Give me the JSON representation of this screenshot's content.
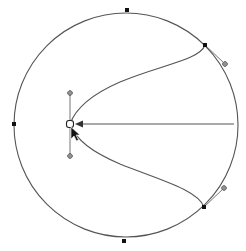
{
  "canvas": {
    "width": 246,
    "height": 251,
    "background": "#ffffff",
    "stroke_color": "#555555"
  },
  "circle": {
    "cx": 126,
    "cy": 125,
    "r": 112
  },
  "anchors": [
    {
      "id": "top",
      "x": 127,
      "y": 10
    },
    {
      "id": "left",
      "x": 14,
      "y": 124
    },
    {
      "id": "bottom",
      "x": 124,
      "y": 241
    },
    {
      "id": "upper-right",
      "x": 205,
      "y": 45
    },
    {
      "id": "lower-right",
      "x": 204,
      "y": 207
    }
  ],
  "handles": [
    {
      "id": "upper-right-handle",
      "x": 225,
      "y": 64
    },
    {
      "id": "lower-right-handle",
      "x": 224,
      "y": 188
    },
    {
      "id": "center-top-handle",
      "x": 70,
      "y": 93
    },
    {
      "id": "center-bottom-handle",
      "x": 70,
      "y": 156
    }
  ],
  "center_node": {
    "x": 70,
    "y": 124
  },
  "cursor": {
    "x": 71,
    "y": 128,
    "icon": "arrow-cursor-icon"
  }
}
